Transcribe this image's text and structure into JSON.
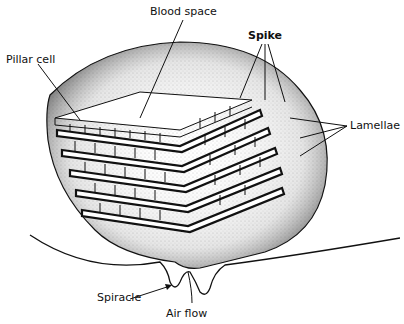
{
  "diagram": {
    "labels": {
      "blood_space": "Blood space",
      "pillar_cell": "Pillar cell",
      "spike": "Spike",
      "lamellae": "Lamellae",
      "spiracle": "Spiracle",
      "air_flow": "Air flow"
    },
    "colors": {
      "ink": "#111111",
      "stipple": "#555555",
      "background": "#ffffff"
    }
  }
}
